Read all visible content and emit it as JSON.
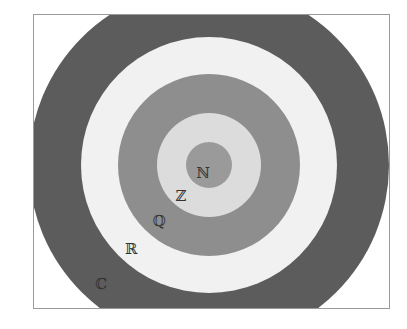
{
  "diagram": {
    "title": "",
    "center": {
      "x": 209,
      "y": 165
    },
    "sets": [
      {
        "symbol": "ℂ",
        "name": "Complex numbers",
        "radius": 180,
        "color": "#5c5c5c",
        "label_pos": {
          "x": 101,
          "y": 284
        }
      },
      {
        "symbol": "ℝ",
        "name": "Real numbers",
        "radius": 128,
        "color": "#f1f1f1",
        "label_pos": {
          "x": 131,
          "y": 249
        }
      },
      {
        "symbol": "ℚ",
        "name": "Rational numbers",
        "radius": 91,
        "color": "#8e8e8e",
        "label_pos": {
          "x": 159,
          "y": 221
        }
      },
      {
        "symbol": "ℤ",
        "name": "Integers",
        "radius": 52,
        "color": "#dcdcdc",
        "label_pos": {
          "x": 181,
          "y": 196
        }
      },
      {
        "symbol": "ℕ",
        "name": "Natural numbers",
        "radius": 23,
        "color": "#9a9a9a",
        "label_pos": {
          "x": 203,
          "y": 173
        }
      }
    ]
  }
}
